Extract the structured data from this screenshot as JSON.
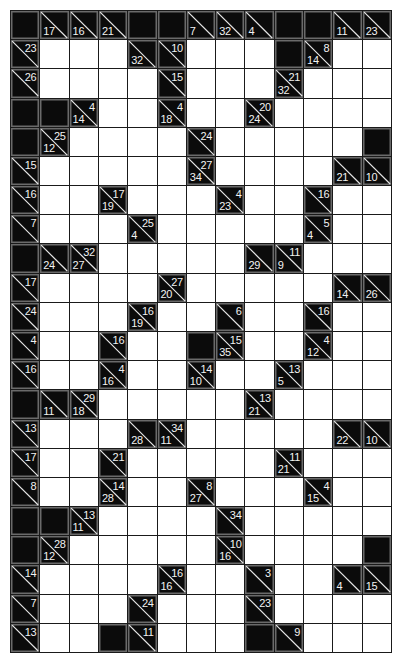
{
  "puzzle": {
    "type": "Kakuro",
    "columns": 13,
    "rows": 22,
    "legend": {
      "W": "empty white entry cell",
      "B": "solid black cell",
      "clue": "black cell with diagonal; 'a' = across sum (top-right), 'd' = down sum (bottom-left)"
    },
    "colors": {
      "grid_line": "#1a1a1a",
      "block": "#0b0b0b",
      "block_border": "#6a6a6a",
      "entry": "#ffffff",
      "clue_text": "#f2f2f2"
    },
    "grid": [
      [
        "B",
        {
          "d": 17
        },
        {
          "d": 16
        },
        {
          "d": 21
        },
        "B",
        "B",
        {
          "d": 7
        },
        {
          "d": 32
        },
        {
          "d": 4
        },
        "B",
        "B",
        {
          "d": 11
        },
        {
          "d": 23
        }
      ],
      [
        {
          "a": 23
        },
        "W",
        "W",
        "W",
        {
          "d": 32
        },
        {
          "a": 10
        },
        "W",
        "W",
        "W",
        "B",
        {
          "a": 8,
          "d": 14
        },
        "W",
        "W"
      ],
      [
        {
          "a": 26
        },
        "W",
        "W",
        "W",
        "W",
        {
          "a": 15
        },
        "W",
        "W",
        "W",
        {
          "a": 21,
          "d": 32
        },
        "W",
        "W",
        "W"
      ],
      [
        "B",
        "B",
        {
          "a": 4,
          "d": 14
        },
        "W",
        "W",
        {
          "a": 4,
          "d": 18
        },
        "W",
        "W",
        {
          "a": 20,
          "d": 24
        },
        "W",
        "W",
        "W",
        "W"
      ],
      [
        "B",
        {
          "a": 25,
          "d": 12
        },
        "W",
        "W",
        "W",
        "W",
        {
          "a": 24
        },
        "W",
        "W",
        "W",
        "W",
        "W",
        "B"
      ],
      [
        {
          "a": 15
        },
        "W",
        "W",
        "W",
        "W",
        "W",
        {
          "a": 27,
          "d": 34
        },
        "W",
        "W",
        "W",
        "W",
        {
          "d": 21
        },
        {
          "d": 10
        }
      ],
      [
        {
          "a": 16
        },
        "W",
        "W",
        {
          "a": 17,
          "d": 19
        },
        "W",
        "W",
        "W",
        {
          "a": 4,
          "d": 23
        },
        "W",
        "W",
        {
          "a": 16
        },
        "W",
        "W"
      ],
      [
        {
          "a": 7
        },
        "W",
        "W",
        "W",
        {
          "a": 25,
          "d": 4
        },
        "W",
        "W",
        "W",
        "W",
        "W",
        {
          "a": 5,
          "d": 4
        },
        "W",
        "W"
      ],
      [
        "B",
        {
          "d": 24
        },
        {
          "a": 32,
          "d": 27
        },
        "W",
        "W",
        "W",
        "W",
        "W",
        {
          "d": 29
        },
        {
          "a": 11,
          "d": 9
        },
        "W",
        "W",
        "W"
      ],
      [
        {
          "a": 17
        },
        "W",
        "W",
        "W",
        "W",
        {
          "a": 27,
          "d": 20
        },
        "W",
        "W",
        "W",
        "W",
        "W",
        {
          "d": 14
        },
        {
          "d": 26
        }
      ],
      [
        {
          "a": 24
        },
        "W",
        "W",
        "W",
        {
          "a": 16,
          "d": 19
        },
        "W",
        "W",
        {
          "a": 6
        },
        "W",
        "W",
        {
          "a": 16
        },
        "W",
        "W"
      ],
      [
        {
          "a": 4
        },
        "W",
        "W",
        {
          "a": 16
        },
        "W",
        "W",
        "B",
        {
          "a": 15,
          "d": 35
        },
        "W",
        "W",
        {
          "a": 4,
          "d": 12
        },
        "W",
        "W"
      ],
      [
        {
          "a": 16
        },
        "W",
        "W",
        {
          "a": 4,
          "d": 16
        },
        "W",
        "W",
        {
          "a": 14,
          "d": 10
        },
        "W",
        "W",
        {
          "a": 13,
          "d": 5
        },
        "W",
        "W",
        "W"
      ],
      [
        "B",
        {
          "d": 11
        },
        {
          "a": 29,
          "d": 18
        },
        "W",
        "W",
        "W",
        "W",
        "W",
        {
          "a": 13,
          "d": 21
        },
        "W",
        "W",
        "W",
        "W"
      ],
      [
        {
          "a": 13
        },
        "W",
        "W",
        "W",
        {
          "d": 28
        },
        {
          "a": 34,
          "d": 11
        },
        "W",
        "W",
        "W",
        "W",
        "W",
        {
          "d": 22
        },
        {
          "d": 10
        }
      ],
      [
        {
          "a": 17
        },
        "W",
        "W",
        {
          "a": 21
        },
        "W",
        "W",
        "W",
        "W",
        "W",
        {
          "a": 11,
          "d": 21
        },
        "W",
        "W",
        "W"
      ],
      [
        {
          "a": 8
        },
        "W",
        "W",
        {
          "a": 14,
          "d": 28
        },
        "W",
        "W",
        {
          "a": 8,
          "d": 27
        },
        "W",
        "W",
        "W",
        {
          "a": 4,
          "d": 15
        },
        "W",
        "W"
      ],
      [
        "B",
        "B",
        {
          "a": 13,
          "d": 11
        },
        "W",
        "W",
        "W",
        "W",
        {
          "a": 34
        },
        "W",
        "W",
        "W",
        "W",
        "W"
      ],
      [
        "B",
        {
          "a": 28,
          "d": 12
        },
        "W",
        "W",
        "W",
        "W",
        "W",
        {
          "a": 10,
          "d": 16
        },
        "W",
        "W",
        "W",
        "W",
        "B"
      ],
      [
        {
          "a": 14
        },
        "W",
        "W",
        "W",
        "W",
        {
          "a": 16,
          "d": 16
        },
        "W",
        "W",
        {
          "a": 3
        },
        "W",
        "W",
        {
          "d": 4
        },
        {
          "d": 15
        }
      ],
      [
        {
          "a": 7
        },
        "W",
        "W",
        "W",
        {
          "a": 24
        },
        "W",
        "W",
        "W",
        {
          "a": 23
        },
        "W",
        "W",
        "W",
        "W"
      ],
      [
        {
          "a": 13
        },
        "W",
        "W",
        "B",
        {
          "a": 11
        },
        "W",
        "W",
        "W",
        "B",
        {
          "a": 9
        },
        "W",
        "W",
        "W"
      ]
    ]
  }
}
